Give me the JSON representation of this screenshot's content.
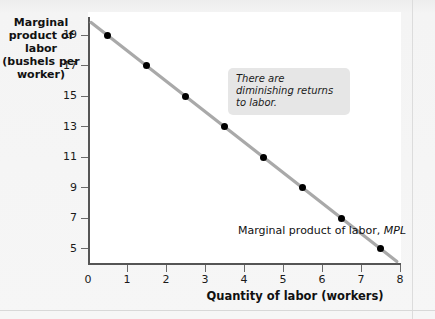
{
  "chart_data": {
    "type": "line",
    "title": "",
    "xlabel": "Quantity of labor (workers)",
    "ylabel": "Marginal product of labor (bushels per worker)",
    "ylabel_lines": [
      "Marginal",
      "product of labor",
      "(bushels per",
      "worker)"
    ],
    "x": [
      0.5,
      1.5,
      2.5,
      3.5,
      4.5,
      5.5,
      6.5,
      7.5
    ],
    "values": [
      19,
      17,
      15,
      13,
      11,
      9,
      7,
      5
    ],
    "series": [
      {
        "name": "Marginal product of labor, MPL",
        "values": [
          19,
          17,
          15,
          13,
          11,
          9,
          7,
          5
        ]
      }
    ],
    "xlim": [
      0,
      8
    ],
    "ylim": [
      4,
      20
    ],
    "xticks": [
      0,
      1,
      2,
      3,
      4,
      5,
      6,
      7,
      8
    ],
    "yticks": [
      5,
      7,
      9,
      11,
      13,
      15,
      17,
      19
    ],
    "xtick_labels": [
      "0",
      "1",
      "2",
      "3",
      "4",
      "5",
      "6",
      "7",
      "8"
    ],
    "ytick_labels": [
      "5",
      "7",
      "9",
      "11",
      "13",
      "15",
      "17",
      "19"
    ],
    "grid": false,
    "legend": "none",
    "line_color": "#a9a9a9",
    "marker_color": "#000000",
    "plot_background": "#ffffff",
    "figure_background": "#f2f2f2",
    "annotations": [
      {
        "text": "There are diminishing returns to labor.",
        "style": "italic",
        "background": "#e6e6e6"
      }
    ],
    "series_label_prefix": "Marginal product of labor, ",
    "series_label_italic": "MPL"
  }
}
